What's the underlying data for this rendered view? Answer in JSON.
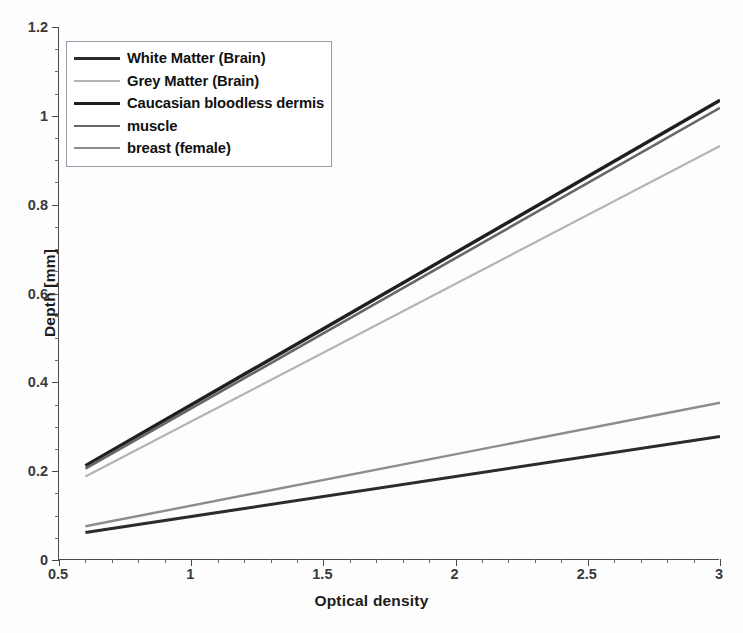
{
  "chart_data": {
    "type": "line",
    "title": "",
    "xlabel": "Optical density",
    "ylabel": "Depth [mm]",
    "xlim": [
      0.5,
      3
    ],
    "ylim": [
      0,
      1.2
    ],
    "xticks": [
      "0.5",
      "1",
      "1.5",
      "2",
      "2.5",
      "3"
    ],
    "xtick_values": [
      0.5,
      1,
      1.5,
      2,
      2.5,
      3
    ],
    "yticks": [
      "0",
      "0.2",
      "0.4",
      "0.6",
      "0.8",
      "1",
      "1.2"
    ],
    "ytick_values": [
      0,
      0.2,
      0.4,
      0.6,
      0.8,
      1.0,
      1.2
    ],
    "grid": false,
    "legend_position": "upper left",
    "x": [
      0.6,
      3.0
    ],
    "series": [
      {
        "name": "White Matter (Brain)",
        "color": "#2b2b2b",
        "width": 3.0,
        "values": [
          0.062,
          0.278
        ]
      },
      {
        "name": "Grey Matter (Brain)",
        "color": "#b4b4b4",
        "width": 2.2,
        "values": [
          0.188,
          0.932
        ]
      },
      {
        "name": "Caucasian bloodless dermis",
        "color": "#1f1f1f",
        "width": 3.4,
        "values": [
          0.212,
          1.035
        ]
      },
      {
        "name": "muscle",
        "color": "#676767",
        "width": 2.6,
        "values": [
          0.206,
          1.018
        ]
      },
      {
        "name": "breast (female)",
        "color": "#8d8d8d",
        "width": 2.4,
        "values": [
          0.076,
          0.354
        ]
      }
    ]
  },
  "axes": {
    "x_title": "Optical density",
    "y_title": "Depth [mm]"
  },
  "legend": {
    "items": [
      {
        "label": "White Matter (Brain)"
      },
      {
        "label": "Grey Matter (Brain)"
      },
      {
        "label": "Caucasian bloodless dermis"
      },
      {
        "label": "muscle"
      },
      {
        "label": "breast (female)"
      }
    ]
  }
}
